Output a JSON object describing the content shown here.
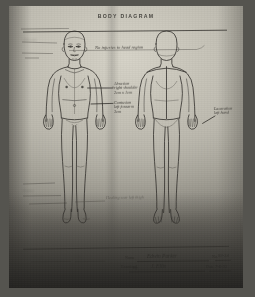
{
  "document": {
    "title": "BODY DIAGRAM",
    "type": "forensic-body-chart",
    "medium": "photocopied handwritten form"
  },
  "figures": [
    {
      "id": "anterior",
      "label": "anterior-body-outline",
      "view": "front"
    },
    {
      "id": "posterior",
      "label": "posterior-body-outline",
      "view": "back"
    }
  ],
  "annotations": [
    {
      "id": "a1",
      "text": "No injuries to head region",
      "area": "head-neck-note"
    },
    {
      "id": "a2",
      "text": "Abrasion\nright shoulder\n2cm x 1cm",
      "area": "right-shoulder-note"
    },
    {
      "id": "a3",
      "text": "Contusion\nleft forearm\n3cm",
      "area": "left-forearm-note"
    },
    {
      "id": "a4",
      "text": "Laceration\nleft hand",
      "area": "left-hand-note"
    },
    {
      "id": "a5",
      "text": "Healing scar\nleft thigh",
      "area": "left-thigh-note"
    },
    {
      "id": "a6",
      "text": "Old scar",
      "area": "left-upper-note"
    },
    {
      "id": "a7",
      "text": "Bruise",
      "area": "left-mid-note"
    }
  ],
  "footer": {
    "left_label_1": "Witness",
    "left_label_2": "Date",
    "name_label": "Name",
    "name_value": "Edwin Parker",
    "number_label": "No.",
    "number_value": "93-34",
    "examiner_label": "Examined",
    "by_label": "By",
    "by_value": "J. Ellis",
    "date_label": "Date",
    "date_value": "7-6-93"
  },
  "colors": {
    "paper": "#b9b6ab",
    "ink": "#2e2c28",
    "shadow": "#33312d",
    "frame": "#55544f"
  }
}
